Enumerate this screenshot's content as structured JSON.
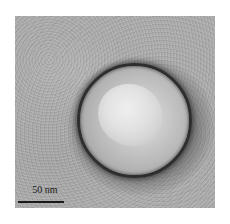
{
  "image": {
    "type": "transmission electron micrograph",
    "subject": "spherical virus-like particle, negatively stained",
    "colors": {
      "background": "#acacac",
      "ring": "#2e2e2e",
      "core": "#e8e8e8"
    }
  },
  "scale_bar": {
    "label": "50 nm"
  }
}
